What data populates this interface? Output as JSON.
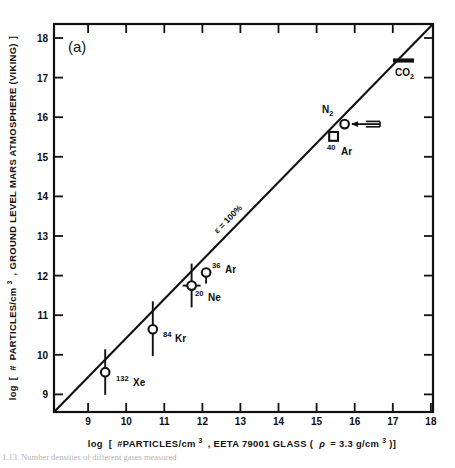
{
  "figure": {
    "panel_label": "(a)",
    "caption_fragment": "1.13.  Number densities of different gases measured"
  },
  "axes": {
    "x": {
      "label_prefix": "log [",
      "label": "log [ #PARTICLES/cm3 , EETA 79001 GLASS ( ρ = 3.3 g/cm3 )]",
      "label_parts": {
        "p1": "log",
        "p2": "[",
        "p3": "#PARTICLES/cm",
        "sup1": "3",
        "p4": ", EETA 79001 GLASS (",
        "p5": "ρ",
        "p6": "= 3.3 g/cm",
        "sup2": "3",
        "p7": ")]"
      },
      "ticks": [
        "9",
        "10",
        "11",
        "12",
        "13",
        "14",
        "15",
        "16",
        "17",
        "18"
      ],
      "min": 8.6,
      "max": 18.55
    },
    "y": {
      "label": "log [ # PARTICLES/cm3 , GROUND LEVEL MARS ATMOSPHERE (VIKING)]",
      "label_parts": {
        "p1": "log",
        "p2": "[",
        "p3": "#",
        "p4": "PARTICLES/cm",
        "sup1": "3",
        "p5": ", GROUND LEVEL MARS ATMOSPHERE (VIKING)",
        "p6": "]"
      },
      "ticks": [
        "9",
        "10",
        "11",
        "12",
        "13",
        "14",
        "15",
        "16",
        "17",
        "18"
      ],
      "min": 8.55,
      "max": 18.35
    }
  },
  "chart_data": {
    "type": "scatter",
    "title": "",
    "xlabel": "log [ #PARTICLES/cm3 , EETA 79001 GLASS ( ρ = 3.3 g/cm3 )]",
    "ylabel": "log [ # PARTICLES/cm3 , GROUND LEVEL MARS ATMOSPHERE (VIKING)]",
    "xlim": [
      8.6,
      18.55
    ],
    "ylim": [
      8.55,
      18.35
    ],
    "xticks": [
      9,
      10,
      11,
      12,
      13,
      14,
      15,
      16,
      17,
      18
    ],
    "yticks": [
      9,
      10,
      11,
      12,
      13,
      14,
      15,
      16,
      17,
      18
    ],
    "grid": false,
    "legend": "none",
    "points": [
      {
        "name": "132Xe",
        "label_sup": "132",
        "label_main": "Xe",
        "x": 9.45,
        "y": 9.55,
        "yerr_low": 0.55,
        "yerr_high": 0.6,
        "marker": "circle",
        "label_dx": 9,
        "label_dy": 13
      },
      {
        "name": "84Kr",
        "label_sup": "84",
        "label_main": "Kr",
        "x": 10.7,
        "y": 10.62,
        "yerr_low": 0.68,
        "yerr_high": 0.72,
        "marker": "circle",
        "label_dx": 9,
        "label_dy": 12
      },
      {
        "name": "20Ne",
        "label_sup": "20",
        "label_main": "Ne",
        "x": 11.72,
        "y": 11.72,
        "yerr_low": 0.5,
        "yerr_high": 0.55,
        "marker": "circle",
        "label_dx": 5,
        "label_dy": 16
      },
      {
        "name": "36Ar",
        "label_sup": "36",
        "label_main": "Ar",
        "x": 12.1,
        "y": 12.05,
        "yerr_low": 0.28,
        "yerr_high": 0.0,
        "marker": "circle",
        "label_dx": 8,
        "label_dy": 3
      },
      {
        "name": "40Ar",
        "label_sup": "40",
        "label_main": "Ar",
        "x": 15.6,
        "y": 15.42,
        "yerr_low": 0.0,
        "yerr_high": 0.0,
        "marker": "square",
        "label_dx": 2,
        "label_dy": 14
      },
      {
        "name": "N2",
        "label_sup": "",
        "label_main": "N2",
        "x": 15.88,
        "y": 15.72,
        "yerr_low": 0.0,
        "yerr_high": 0.0,
        "marker": "circle-arrow-left",
        "label_dx": -16,
        "label_dy": -8
      },
      {
        "name": "CO2",
        "label_sup": "",
        "label_main": "CO2",
        "x": 17.55,
        "y": 17.4,
        "yerr_low": 0.0,
        "yerr_high": 0.0,
        "marker": "bar",
        "label_dx": 1,
        "label_dy": 14
      }
    ],
    "reference_line": {
      "label": "ε = 100%",
      "label_parts": {
        "eps": "ε",
        "eq": "=",
        "val": "100%"
      },
      "from": [
        8.6,
        8.55
      ],
      "to": [
        18.55,
        18.35
      ],
      "slope": 1,
      "intercept": 0
    }
  }
}
